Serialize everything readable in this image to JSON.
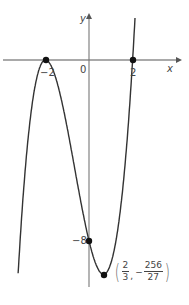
{
  "chart_data": {
    "type": "line",
    "title": "",
    "function": "y = (x+2)^2 (x-2)",
    "xlabel": "x",
    "ylabel": "y",
    "x_ticks": [
      "-2",
      "0",
      "2"
    ],
    "y_ticks": [
      "-8"
    ],
    "grid": false,
    "points": [
      {
        "x": -2,
        "y": 0,
        "label": "-2"
      },
      {
        "x": 2,
        "y": 0,
        "label": "2"
      },
      {
        "x": 0,
        "y": -8,
        "label": "-8"
      },
      {
        "x": 0.6667,
        "y": -9.4815,
        "label": "(2/3, -256/27)"
      }
    ],
    "min_point": {
      "x_num": "2",
      "x_den": "3",
      "y_num": "256",
      "y_den": "27",
      "y_sign": "−"
    }
  },
  "labels": {
    "x_axis": "x",
    "y_axis": "y",
    "origin": "0",
    "x_neg2": "−2",
    "x_2": "2",
    "y_neg8": "−8",
    "comma": ","
  },
  "colors": {
    "curve": "#333333",
    "axis": "#555555"
  }
}
